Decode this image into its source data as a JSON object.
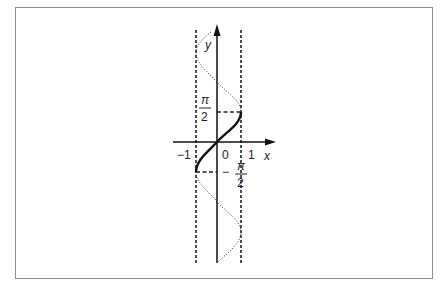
{
  "figure": {
    "axes": {
      "x_label": "x",
      "y_label": "y",
      "origin_label": "0",
      "x_ticks": [
        "-1",
        "1"
      ],
      "y_marks": [
        {
          "numerator": "π",
          "denominator": "2",
          "sign": ""
        },
        {
          "numerator": "π",
          "denominator": "2",
          "sign": "−"
        }
      ]
    },
    "curves": [
      {
        "name": "x = sin y",
        "style": "dotted"
      },
      {
        "name": "y = arcsin x",
        "style": "solid"
      }
    ],
    "guides": [
      "x = -1 (dashed)",
      "x = 1 (dashed)",
      "y = π/2 (dashed)",
      "y = -π/2 (dashed)"
    ]
  },
  "labels": {
    "x": "x",
    "y": "y",
    "zero": "0",
    "minus_one": "−1",
    "one": "1",
    "pi": "π",
    "two": "2",
    "minus": "−"
  }
}
